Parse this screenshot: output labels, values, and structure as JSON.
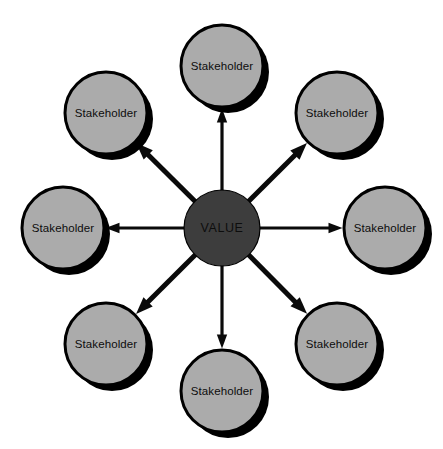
{
  "diagram": {
    "type": "radial-hub-and-spoke",
    "canvas": {
      "width": 443,
      "height": 449,
      "background": "#ffffff"
    },
    "colors": {
      "hub_fill": "#3d3d3d",
      "node_fill": "#ababab",
      "outline": "#000000",
      "shadow": "#000000",
      "arrow": "#0a0a0a",
      "text": "#0d0d0d"
    },
    "hub": {
      "label": "VALUE",
      "cx": 222,
      "cy": 228,
      "r": 38
    },
    "nodes": [
      {
        "label": "Stakeholder",
        "cx": 222,
        "cy": 66,
        "r": 41,
        "angle_deg": 270,
        "position": "top"
      },
      {
        "label": "Stakeholder",
        "cx": 337,
        "cy": 113,
        "r": 41,
        "angle_deg": 315,
        "position": "top-right"
      },
      {
        "label": "Stakeholder",
        "cx": 385,
        "cy": 228,
        "r": 41,
        "angle_deg": 0,
        "position": "right"
      },
      {
        "label": "Stakeholder",
        "cx": 337,
        "cy": 344,
        "r": 41,
        "angle_deg": 45,
        "position": "bottom-right"
      },
      {
        "label": "Stakeholder",
        "cx": 222,
        "cy": 391,
        "r": 41,
        "angle_deg": 90,
        "position": "bottom"
      },
      {
        "label": "Stakeholder",
        "cx": 106,
        "cy": 344,
        "r": 41,
        "angle_deg": 135,
        "position": "bottom-left"
      },
      {
        "label": "Stakeholder",
        "cx": 63,
        "cy": 228,
        "r": 41,
        "angle_deg": 180,
        "position": "left"
      },
      {
        "label": "Stakeholder",
        "cx": 106,
        "cy": 113,
        "r": 41,
        "angle_deg": 225,
        "position": "top-left"
      }
    ],
    "arrows": [
      {
        "from": "hub",
        "to": "top",
        "direction": "outward",
        "stroke_width": 3.2
      },
      {
        "from": "hub",
        "to": "top-right",
        "direction": "outward",
        "stroke_width": 5.0
      },
      {
        "from": "hub",
        "to": "right",
        "direction": "outward",
        "stroke_width": 3.2
      },
      {
        "from": "hub",
        "to": "bottom-right",
        "direction": "outward",
        "stroke_width": 5.0
      },
      {
        "from": "hub",
        "to": "bottom",
        "direction": "outward",
        "stroke_width": 3.2
      },
      {
        "from": "hub",
        "to": "bottom-left",
        "direction": "outward",
        "stroke_width": 5.0
      },
      {
        "from": "hub",
        "to": "left",
        "direction": "outward",
        "stroke_width": 3.2
      },
      {
        "from": "hub",
        "to": "top-left",
        "direction": "outward",
        "stroke_width": 5.0
      }
    ]
  }
}
